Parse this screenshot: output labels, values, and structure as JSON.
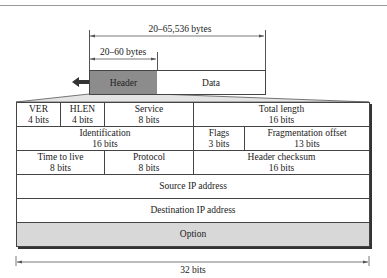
{
  "overview": {
    "total_size_label": "20–65,536 bytes",
    "header_size_label": "20–60 bytes",
    "header_label": "Header",
    "data_label": "Data",
    "direction_icon": "arrow-left-icon"
  },
  "header_format": {
    "rows": [
      [
        {
          "name": "VER",
          "bits": "4 bits"
        },
        {
          "name": "HLEN",
          "bits": "4 bits"
        },
        {
          "name": "Service",
          "bits": "8 bits"
        },
        {
          "name": "Total length",
          "bits": "16 bits"
        }
      ],
      [
        {
          "name": "Identification",
          "bits": "16 bits"
        },
        {
          "name": "Flags",
          "bits": "3 bits"
        },
        {
          "name": "Fragmentation offset",
          "bits": "13 bits"
        }
      ],
      [
        {
          "name": "Time to live",
          "bits": "8 bits"
        },
        {
          "name": "Protocol",
          "bits": "8 bits"
        },
        {
          "name": "Header checksum",
          "bits": "16 bits"
        }
      ],
      [
        {
          "name": "Source IP address"
        }
      ],
      [
        {
          "name": "Destination IP address"
        }
      ],
      [
        {
          "name": "Option"
        }
      ]
    ],
    "width_label": "32 bits"
  },
  "colors": {
    "header_fill": "#8c8c8c",
    "option_fill": "#d8d8d8",
    "line": "#444444"
  }
}
